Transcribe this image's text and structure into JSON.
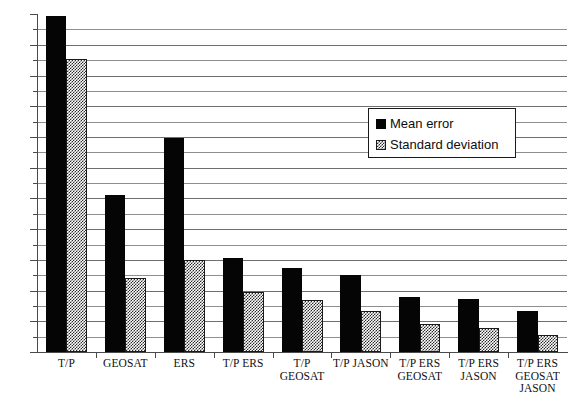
{
  "chart_data": {
    "type": "bar",
    "title": "",
    "subtitle": "",
    "xlabel": "",
    "ylabel": "",
    "ylim": [
      0,
      22
    ],
    "y_major_step": 2,
    "y_minor_step": 1,
    "grid": true,
    "grid_axis": "y",
    "legend_position": "inside-upper-right",
    "categories": [
      "T/P",
      "GEOSAT",
      "ERS",
      "T/P ERS",
      "T/P GEOSAT",
      "T/P JASON",
      "T/P ERS GEOSAT",
      "T/P ERS JASON",
      "T/P ERS GEOSAT JASON"
    ],
    "y_tick_labels": [
      "0",
      "2",
      "4",
      "6",
      "8",
      "10",
      "12",
      "14",
      "16",
      "18",
      "20",
      "22"
    ],
    "series": [
      {
        "name": "Mean error",
        "color": "#050505",
        "fill": "solid",
        "values": [
          21.9,
          10.2,
          13.9,
          6.1,
          5.5,
          5.0,
          3.6,
          3.45,
          2.65
        ]
      },
      {
        "name": "Standard deviation",
        "color": "#2b2b2b",
        "fill": "checkerboard-hatch",
        "values": [
          19.1,
          4.8,
          6.0,
          3.9,
          3.4,
          2.65,
          1.8,
          1.55,
          1.1
        ]
      }
    ]
  },
  "legend": {
    "items": [
      {
        "label": "Mean error"
      },
      {
        "label": "Standard deviation"
      }
    ]
  },
  "colors": {
    "mean_error": "#050505",
    "standard_deviation": "#2b2b2b",
    "gridline": "#8e8e8e",
    "axis": "#4a4a4a",
    "background": "#ffffff"
  }
}
